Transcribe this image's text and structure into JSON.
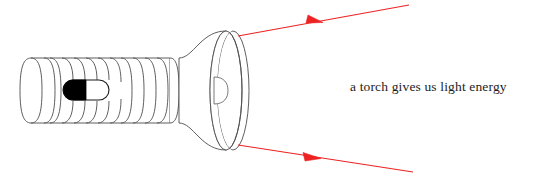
{
  "scene": {
    "title": "a torch gives us light energy",
    "width": 540,
    "height": 190,
    "background_color": "#ffffff"
  },
  "caption": {
    "text": "a torch gives us light energy",
    "color": "#1c1c1c"
  },
  "torch": {
    "outline_color": "#4d4d4d",
    "fill_color": "#ffffff",
    "switch": {
      "on_half_color": "#000000",
      "off_half_color": "#ffffff",
      "label": "power-switch"
    },
    "handle": {
      "label": "ribbed handle",
      "rib_count": 11
    },
    "head": {
      "label": "reflector head",
      "bulb_label": "bulb"
    }
  },
  "light_rays": {
    "color": "#ee2222",
    "count": 2,
    "upper_label": "upper light ray",
    "lower_label": "lower light ray",
    "arrow_label": "ray direction arrow"
  }
}
